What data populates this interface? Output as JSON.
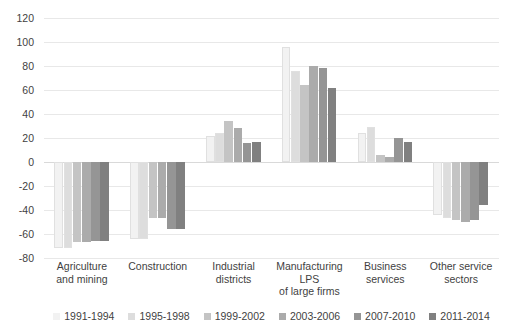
{
  "chart_data": {
    "type": "bar",
    "title": "",
    "subtitle": "",
    "xlabel": "",
    "ylabel": "",
    "ylim": [
      -80,
      120
    ],
    "ytick_step": 20,
    "yticks": [
      120,
      100,
      80,
      60,
      40,
      20,
      0,
      -20,
      -40,
      -60,
      -80
    ],
    "grid": true,
    "legend_position": "bottom",
    "orientation": "vertical",
    "categories": [
      "Agriculture and mining",
      "Construction",
      "Industrial districts",
      "Manufacturing LPS of large firms",
      "Business services",
      "Other service sectors"
    ],
    "category_label_lines": [
      [
        "Agriculture",
        "and mining"
      ],
      [
        "Construction"
      ],
      [
        "Industrial",
        "districts"
      ],
      [
        "Manufacturing",
        "LPS",
        "of large firms"
      ],
      [
        "Business",
        "services"
      ],
      [
        "Other service",
        "sectors"
      ]
    ],
    "series": [
      {
        "name": "1991-1994",
        "color": "#f2f2f2",
        "values": [
          -72,
          -64,
          22,
          96,
          24,
          -44
        ]
      },
      {
        "name": "1995-1998",
        "color": "#dddddd",
        "values": [
          -72,
          -64,
          24,
          76,
          29,
          -47
        ]
      },
      {
        "name": "1999-2002",
        "color": "#c4c4c4",
        "values": [
          -67,
          -47,
          34,
          64,
          6,
          -48
        ]
      },
      {
        "name": "2003-2006",
        "color": "#ababab",
        "values": [
          -67,
          -47,
          28,
          80,
          4,
          -50
        ]
      },
      {
        "name": "2007-2010",
        "color": "#959595",
        "values": [
          -66,
          -56,
          16,
          78,
          20,
          -48
        ]
      },
      {
        "name": "2011-2014",
        "color": "#808080",
        "values": [
          -66,
          -56,
          17,
          62,
          17,
          -36
        ]
      }
    ]
  },
  "legend": {
    "items": [
      {
        "label": "1991-1994",
        "color": "#f2f2f2"
      },
      {
        "label": "1995-1998",
        "color": "#dddddd"
      },
      {
        "label": "1999-2002",
        "color": "#c4c4c4"
      },
      {
        "label": "2003-2006",
        "color": "#ababab"
      },
      {
        "label": "2007-2010",
        "color": "#959595"
      },
      {
        "label": "2011-2014",
        "color": "#808080"
      }
    ]
  }
}
